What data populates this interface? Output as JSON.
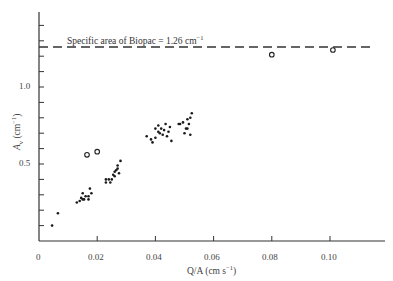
{
  "chart_data": {
    "type": "scatter",
    "title": "",
    "xlabel": "Q/A (cm s⁻¹)",
    "ylabel": "Aᵥ (cm⁻¹)",
    "xlim": [
      0,
      0.12
    ],
    "ylim": [
      0,
      1.5
    ],
    "x_ticks": [
      "0",
      "0.02",
      "0.04",
      "0.06",
      "0.08",
      "0.10"
    ],
    "y_ticks": [
      "0.5",
      "1.0"
    ],
    "grid": false,
    "annotations": [
      {
        "text": "Specific area of Biopac = 1.26 cm⁻¹",
        "type": "dashed-hline",
        "y": 1.26
      }
    ],
    "series": [
      {
        "name": "filled points",
        "marker": "dot",
        "points": [
          [
            0.0045,
            0.1
          ],
          [
            0.0065,
            0.18
          ],
          [
            0.013,
            0.25
          ],
          [
            0.014,
            0.26
          ],
          [
            0.0145,
            0.28
          ],
          [
            0.015,
            0.31
          ],
          [
            0.015,
            0.27
          ],
          [
            0.0155,
            0.27
          ],
          [
            0.016,
            0.29
          ],
          [
            0.017,
            0.27
          ],
          [
            0.017,
            0.29
          ],
          [
            0.018,
            0.31
          ],
          [
            0.0175,
            0.34
          ],
          [
            0.023,
            0.4
          ],
          [
            0.023,
            0.38
          ],
          [
            0.024,
            0.4
          ],
          [
            0.0245,
            0.38
          ],
          [
            0.025,
            0.4
          ],
          [
            0.0255,
            0.43
          ],
          [
            0.026,
            0.42
          ],
          [
            0.026,
            0.45
          ],
          [
            0.0265,
            0.46
          ],
          [
            0.027,
            0.47
          ],
          [
            0.027,
            0.49
          ],
          [
            0.028,
            0.52
          ],
          [
            0.0275,
            0.44
          ],
          [
            0.037,
            0.68
          ],
          [
            0.0385,
            0.66
          ],
          [
            0.039,
            0.64
          ],
          [
            0.04,
            0.67
          ],
          [
            0.04,
            0.73
          ],
          [
            0.041,
            0.71
          ],
          [
            0.041,
            0.75
          ],
          [
            0.0415,
            0.7
          ],
          [
            0.042,
            0.73
          ],
          [
            0.0425,
            0.69
          ],
          [
            0.043,
            0.72
          ],
          [
            0.0435,
            0.76
          ],
          [
            0.044,
            0.68
          ],
          [
            0.0445,
            0.71
          ],
          [
            0.0455,
            0.65
          ],
          [
            0.045,
            0.74
          ],
          [
            0.048,
            0.76
          ],
          [
            0.0485,
            0.76
          ],
          [
            0.0495,
            0.77
          ],
          [
            0.05,
            0.7
          ],
          [
            0.0505,
            0.73
          ],
          [
            0.051,
            0.79
          ],
          [
            0.0515,
            0.76
          ],
          [
            0.052,
            0.69
          ],
          [
            0.052,
            0.8
          ],
          [
            0.0525,
            0.83
          ],
          [
            0.051,
            0.73
          ]
        ]
      },
      {
        "name": "open circles",
        "marker": "circle",
        "points": [
          [
            0.0165,
            0.56
          ],
          [
            0.02,
            0.58
          ],
          [
            0.08,
            1.21
          ],
          [
            0.101,
            1.24
          ]
        ]
      }
    ]
  },
  "labels": {
    "annotation": "Specific area of Biopac = 1.26 cm",
    "annotation_sup": "−1",
    "x_axis_main": "Q/A (cm s",
    "x_axis_sup": "−1",
    "x_axis_close": ")",
    "y_axis_main": "A",
    "y_axis_sub": "v",
    "y_axis_rest": " (cm",
    "y_axis_sup": "−1",
    "y_axis_close": ")",
    "x_tick_0": "0",
    "x_tick_1": "0.02",
    "x_tick_2": "0.04",
    "x_tick_3": "0.06",
    "x_tick_4": "0.08",
    "x_tick_5": "0.10",
    "y_tick_05": "0.5",
    "y_tick_10": "1.0"
  }
}
